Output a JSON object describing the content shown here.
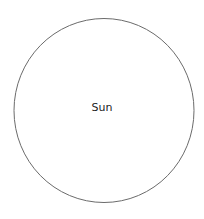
{
  "diagram": {
    "shape": "circle",
    "label": "Sun",
    "stroke_color": "#6b6b6b",
    "fill_color": "#ffffff"
  }
}
